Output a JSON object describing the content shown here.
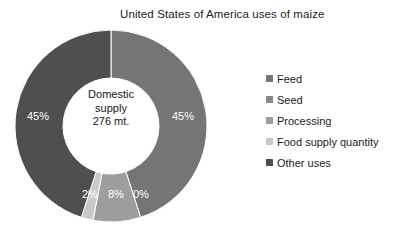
{
  "chart_data": {
    "type": "pie",
    "variant": "donut",
    "title": "United States of America uses of maize",
    "xlabel": "",
    "ylabel": "",
    "legend_position": "right",
    "grid": false,
    "center_label": {
      "line1": "Domestic",
      "line2": "supply",
      "line3": "276 mt."
    },
    "categories": [
      "Feed",
      "Seed",
      "Processing",
      "Food supply quantity",
      "Other uses"
    ],
    "values": [
      45,
      0,
      8,
      2,
      45
    ],
    "data_labels": [
      "45%",
      "0%",
      "8%",
      "2%",
      "45%"
    ],
    "colors": [
      "#757575",
      "#8a8a8a",
      "#9e9e9e",
      "#c9c9c9",
      "#4f4f4f"
    ],
    "slices": [
      {
        "name": "Feed",
        "value": 45,
        "label": "45%",
        "color": "#757575"
      },
      {
        "name": "Seed",
        "value": 0,
        "label": "0%",
        "color": "#8a8a8a"
      },
      {
        "name": "Processing",
        "value": 8,
        "label": "8%",
        "color": "#9e9e9e"
      },
      {
        "name": "Food supply quantity",
        "value": 2,
        "label": "2%",
        "color": "#c9c9c9"
      },
      {
        "name": "Other uses",
        "value": 45,
        "label": "45%",
        "color": "#4f4f4f"
      }
    ]
  },
  "legend": {
    "items": [
      {
        "label": "Feed",
        "color": "#757575"
      },
      {
        "label": "Seed",
        "color": "#8a8a8a"
      },
      {
        "label": "Processing",
        "color": "#9e9e9e"
      },
      {
        "label": "Food supply quantity",
        "color": "#c9c9c9"
      },
      {
        "label": "Other uses",
        "color": "#4f4f4f"
      }
    ]
  }
}
